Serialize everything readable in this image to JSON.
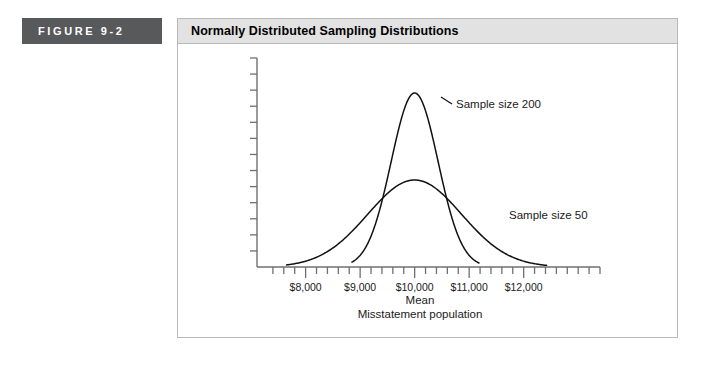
{
  "figure": {
    "label": "FIGURE  9-2",
    "title": "Normally Distributed Sampling Distributions",
    "label_bg": "#58595b",
    "title_bg": "#e2e2e2",
    "border_color": "#b9b9b9"
  },
  "chart_data": {
    "type": "line",
    "title": "Normally Distributed Sampling Distributions",
    "xlabel_lines": [
      "Mean",
      "Misstatement population"
    ],
    "ylabel": "",
    "grid": false,
    "legend": "inline-annotations",
    "x_tick_labels": [
      "$8,000",
      "$9,000",
      "$10,000",
      "$11,000",
      "$12,000"
    ],
    "x_tick_values": [
      8000,
      9000,
      10000,
      11000,
      12000
    ],
    "x_minor_ticks_per_interval": 5,
    "y_tick_count": 13,
    "y_tick_labels": [],
    "xlim": [
      7200,
      13400
    ],
    "ylim": [
      0,
      1
    ],
    "mean": 10000,
    "series": [
      {
        "name": "Sample size 200",
        "annotation": "Sample size 200",
        "mean": 10000,
        "std": 430,
        "peak_height": 1.0,
        "x_start": 8850,
        "x_end": 11180
      },
      {
        "name": "Sample size 50",
        "annotation": "Sample size 50",
        "mean": 10000,
        "std": 860,
        "peak_height": 0.5,
        "x_start": 7650,
        "x_end": 12420
      }
    ]
  }
}
